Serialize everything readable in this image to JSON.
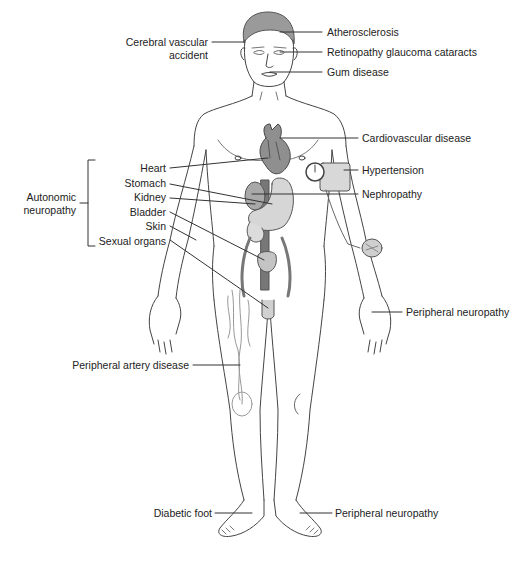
{
  "figure": {
    "caption_visible": false
  },
  "labels": {
    "atherosclerosis": "Atherosclerosis",
    "cerebral_line1": "Cerebral vascular",
    "cerebral_line2": "accident",
    "retinopathy": "Retinopathy glaucoma cataracts",
    "gum": "Gum disease",
    "cardiovascular": "Cardiovascular disease",
    "hypertension": "Hypertension",
    "nephropathy": "Nephropathy",
    "autonomic_line1": "Autonomic",
    "autonomic_line2": "neuropathy",
    "heart": "Heart",
    "stomach": "Stomach",
    "kidney": "Kidney",
    "bladder": "Bladder",
    "skin": "Skin",
    "sexual_organs": "Sexual organs",
    "peripheral_neuropathy_hand": "Peripheral neuropathy",
    "peripheral_artery": "Peripheral artery disease",
    "diabetic_foot": "Diabetic foot",
    "peripheral_neuropathy_foot": "Peripheral neuropathy"
  },
  "colors": {
    "line": "#333333",
    "organ_fill": "#c8c8c8",
    "organ_dark": "#888888",
    "text": "#222222"
  }
}
